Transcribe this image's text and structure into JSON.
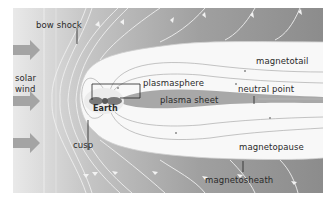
{
  "diagram": {
    "labels": {
      "bow_shock": "bow shock",
      "solar_wind_line1": "solar",
      "solar_wind_line2": "wind",
      "plasmasphere": "plasmasphere",
      "earth": "Earth",
      "plasma_sheet": "plasma sheet",
      "magnetotail": "magnetotail",
      "neutral_point": "neutral point",
      "cusp": "cusp",
      "magnetopause": "magnetopause",
      "magnetosheath": "magnetosheath"
    },
    "colors": {
      "sheath_dark": "#8e8e8e",
      "sheath_light": "#d4d4d4",
      "magnetosphere_fill": "#f7f7f7",
      "plasma_sheet": "#a9a9a9",
      "field_line": "#e6e6e6",
      "inner_line": "#9a9a9a",
      "arrow": "#a3a3a3"
    }
  }
}
